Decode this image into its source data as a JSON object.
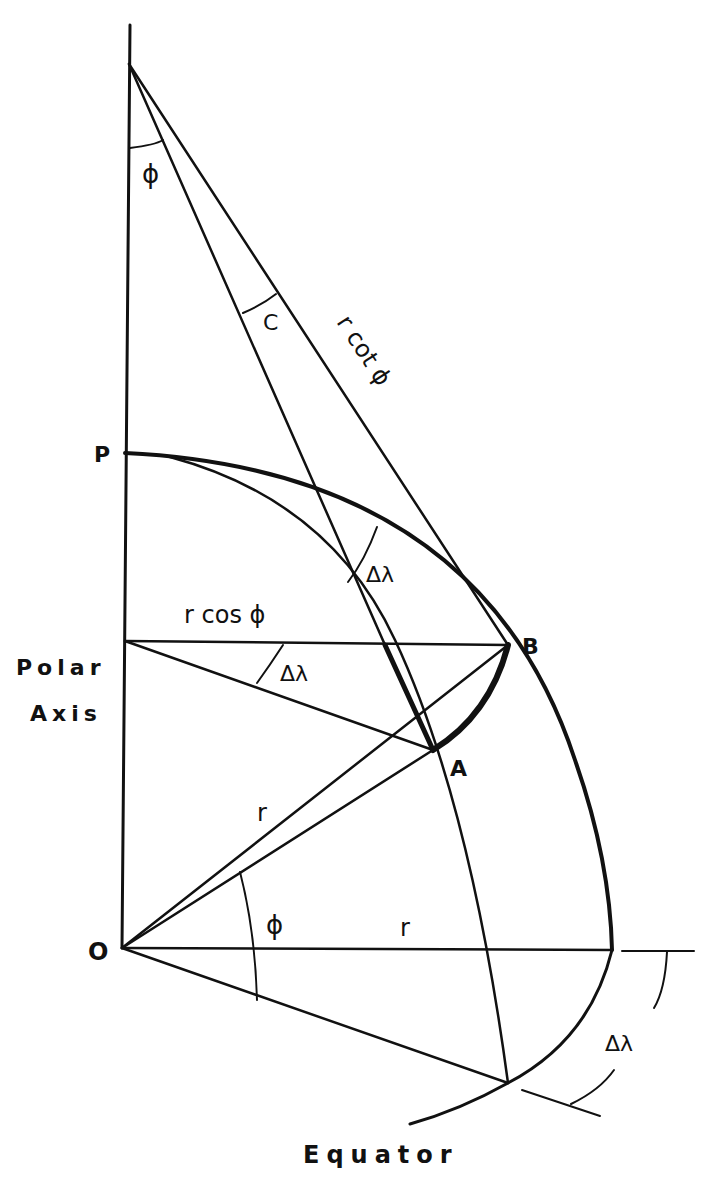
{
  "diagram": {
    "type": "geometry",
    "colors": {
      "ink": "#111111",
      "background": "#ffffff"
    },
    "points": {
      "P": "P",
      "B": "B",
      "A": "A",
      "O": "O",
      "C": "C"
    },
    "labels": {
      "phi_apex": "ϕ",
      "c_angle": "C",
      "r_cot_phi": "r cot ϕ",
      "delta_lambda_upper": "Δλ",
      "r_cos_phi": "r cos ϕ",
      "delta_lambda_middle": "Δλ",
      "polar": "Polar",
      "axis": "Axis",
      "r_diagonal": "r",
      "phi_origin": "ϕ",
      "r_horizontal": "r",
      "delta_lambda_lower": "Δλ",
      "equator": "Equator"
    }
  }
}
